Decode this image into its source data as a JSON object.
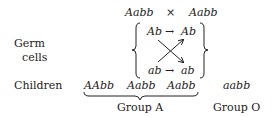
{
  "parents": {
    "left": "Aabb",
    "cross_symbol": "×",
    "right": "Aabb"
  },
  "labels": {
    "germ_line1": "Germ",
    "germ_line2": "cells",
    "children": "Children"
  },
  "germ_cells": {
    "top_left": "Ab",
    "top_right": "Ab",
    "bottom_left": "ab",
    "bottom_right": "ab",
    "arrow": "→"
  },
  "children": [
    "AAbb",
    "Aabb",
    "Aabb",
    "aabb"
  ],
  "groups": {
    "a": "Group A",
    "o": "Group O"
  },
  "colors": {
    "ink": "#222222",
    "background": "#ffffff"
  }
}
